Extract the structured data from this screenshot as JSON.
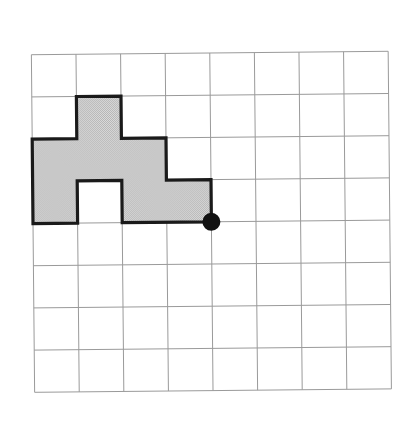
{
  "figure": {
    "background_color": "#ffffff"
  },
  "grid": {
    "columns": 8,
    "rows": 8,
    "origin_x": 33,
    "origin_y": 53,
    "cell_width": 44.6,
    "cell_height": 42.2,
    "line_color": "#9a9a9a",
    "line_width": 1,
    "rotation_degrees": -0.55
  },
  "shape": {
    "name": "shaded-polygon",
    "fill_color": "#c9c9c9",
    "fill_style": "dithered-gray",
    "outline_color": "#1a1a1a",
    "outline_width": 3.2,
    "filled_cells": [
      {
        "col": 1,
        "row": 1
      },
      {
        "col": 0,
        "row": 2
      },
      {
        "col": 1,
        "row": 2
      },
      {
        "col": 2,
        "row": 2
      },
      {
        "col": 0,
        "row": 3
      },
      {
        "col": 2,
        "row": 3
      },
      {
        "col": 3,
        "row": 3
      }
    ],
    "hole_cells": [
      {
        "col": 1,
        "row": 3
      }
    ],
    "area_cells": 7,
    "outline_vertices": [
      {
        "col": 1,
        "row": 1
      },
      {
        "col": 2,
        "row": 1
      },
      {
        "col": 2,
        "row": 2
      },
      {
        "col": 3,
        "row": 2
      },
      {
        "col": 3,
        "row": 3
      },
      {
        "col": 4,
        "row": 3
      },
      {
        "col": 4,
        "row": 4
      },
      {
        "col": 2,
        "row": 4
      },
      {
        "col": 2,
        "row": 3
      },
      {
        "col": 1,
        "row": 3
      },
      {
        "col": 1,
        "row": 4
      },
      {
        "col": 0,
        "row": 4
      },
      {
        "col": 0,
        "row": 2
      },
      {
        "col": 1,
        "row": 2
      }
    ]
  },
  "marker": {
    "name": "corner-dot",
    "col": 4,
    "row": 4,
    "radius": 9,
    "color": "#121212",
    "label": ""
  }
}
